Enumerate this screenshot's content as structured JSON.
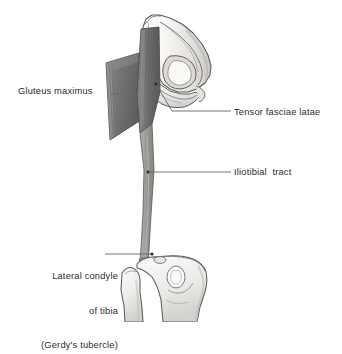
{
  "figure": {
    "background_color": "#ffffff",
    "width": 342,
    "height": 322
  },
  "labels": {
    "gluteus_maximus": "Gluteus maximus",
    "tensor_fasciae_latae": "Tensor fasciae latae",
    "iliotibial_tract": "Iliotibial  tract",
    "lateral_condyle_line1": "Lateral condyle",
    "lateral_condyle_line2": "of tibia",
    "lateral_condyle_line3": "(Gerdy's tubercle)"
  },
  "colors": {
    "text": "#2b2b2b",
    "leader_line": "#6b6b6b",
    "muscle_dark": "#6f6f6f",
    "muscle_mid": "#8a8a8a",
    "tract_band": "#9a9a9a",
    "bone_fill": "#f2f1ef",
    "bone_shade": "#cfcdc9",
    "outline": "#5a5a5a",
    "marker_dot": "#2b2b2b"
  },
  "structures": {
    "hip_bone": "hip-bone",
    "gluteus_maximus_muscle": "gluteus-maximus-muscle",
    "tensor_fasciae_latae_muscle": "tensor-fasciae-latae-muscle",
    "iliotibial_tract_band": "iliotibial-tract-band",
    "tibia": "tibia",
    "fibula": "fibula",
    "femur_shaft": "femur-shaft"
  }
}
